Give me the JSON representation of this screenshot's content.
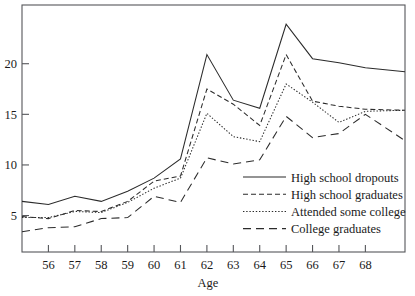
{
  "chart_data": {
    "type": "line",
    "title": "",
    "xlabel": "Age",
    "ylabel": "",
    "xlim": [
      55.0,
      69.5
    ],
    "ylim": [
      1.4,
      25.8
    ],
    "grid": false,
    "legend_position": "inside-lower-right",
    "xticks": [
      56,
      57,
      58,
      59,
      60,
      61,
      62,
      63,
      64,
      65,
      66,
      67,
      68
    ],
    "xtick_labels": [
      "56",
      "57",
      "58",
      "59",
      "60",
      "61",
      "62",
      "63",
      "64",
      "65",
      "66",
      "67",
      "68"
    ],
    "yticks": [
      5,
      10,
      15,
      20
    ],
    "ytick_labels": [
      "5",
      "10",
      "15",
      "20"
    ],
    "x": [
      55.0,
      56,
      57,
      58,
      59,
      60,
      61,
      62,
      63,
      64,
      65,
      66,
      67,
      68,
      69.5
    ],
    "series": [
      {
        "name": "High school dropouts",
        "style": "solid",
        "values": [
          6.4,
          6.1,
          6.9,
          6.4,
          7.4,
          8.7,
          10.6,
          20.9,
          16.4,
          15.6,
          23.9,
          20.5,
          20.1,
          19.6,
          19.2
        ]
      },
      {
        "name": "High school graduates",
        "style": "dashed",
        "values": [
          4.9,
          4.7,
          5.5,
          5.4,
          6.4,
          8.4,
          8.9,
          17.5,
          16.0,
          13.9,
          20.9,
          16.3,
          15.8,
          15.5,
          15.4
        ]
      },
      {
        "name": "Attended some college",
        "style": "dotted",
        "values": [
          4.8,
          4.8,
          5.4,
          5.3,
          6.3,
          7.7,
          8.7,
          15.1,
          12.8,
          12.3,
          18.0,
          16.2,
          14.2,
          15.3,
          15.4
        ]
      },
      {
        "name": "College graduates",
        "style": "longdash",
        "values": [
          3.4,
          3.8,
          3.9,
          4.7,
          4.8,
          6.9,
          6.3,
          10.7,
          10.1,
          10.5,
          14.8,
          12.7,
          13.1,
          15.0,
          12.4
        ]
      }
    ]
  },
  "legend": {
    "items": [
      {
        "label": "High school dropouts",
        "style": "solid"
      },
      {
        "label": "High school graduates",
        "style": "dashed"
      },
      {
        "label": "Attended some college",
        "style": "dotted"
      },
      {
        "label": "College graduates",
        "style": "longdash"
      }
    ]
  }
}
